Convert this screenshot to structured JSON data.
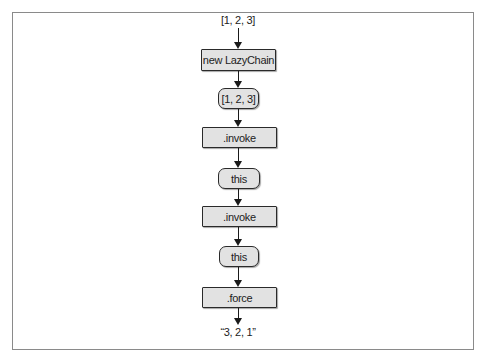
{
  "diagram": {
    "type": "flowchart",
    "direction": "top-to-bottom",
    "input_label": "[1, 2, 3]",
    "output_label": "“3, 2, 1”",
    "nodes": [
      {
        "id": "n1",
        "shape": "rect",
        "label": "new LazyChain"
      },
      {
        "id": "n2",
        "shape": "round",
        "label": "[1, 2, 3]"
      },
      {
        "id": "n3",
        "shape": "rect",
        "label": ".invoke"
      },
      {
        "id": "n4",
        "shape": "round",
        "label": "this"
      },
      {
        "id": "n5",
        "shape": "rect",
        "label": ".invoke"
      },
      {
        "id": "n6",
        "shape": "round",
        "label": "this"
      },
      {
        "id": "n7",
        "shape": "rect",
        "label": ".force"
      }
    ],
    "edges": [
      [
        "input",
        "n1"
      ],
      [
        "n1",
        "n2"
      ],
      [
        "n2",
        "n3"
      ],
      [
        "n3",
        "n4"
      ],
      [
        "n4",
        "n5"
      ],
      [
        "n5",
        "n6"
      ],
      [
        "n6",
        "n7"
      ],
      [
        "n7",
        "output"
      ]
    ],
    "colors": {
      "box_fill": "#e2e2e2",
      "box_border": "#2a2a2a",
      "frame_border": "#8a8a8a",
      "arrow": "#1a1a1a"
    }
  }
}
